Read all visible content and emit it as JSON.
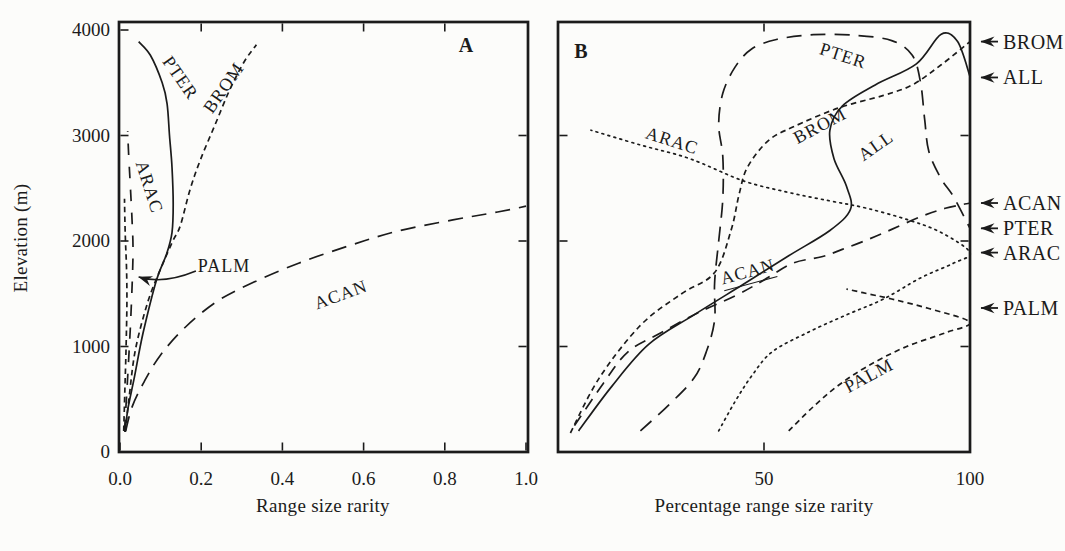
{
  "figure_ink_color": "#1b1b1b",
  "background_color": "#fcfcfa",
  "chart_data": [
    {
      "id": "A",
      "type": "line",
      "panel_label": "A",
      "xlabel": "Range size rarity",
      "ylabel": "Elevation (m)",
      "xlim": [
        0.0,
        1.0
      ],
      "ylim": [
        0,
        4000
      ],
      "grid": false,
      "x_tick_values": [
        0.0,
        0.2,
        0.4,
        0.6,
        0.8,
        1.0
      ],
      "x_tick_labels": [
        "0.0",
        "0.2",
        "0.4",
        "0.6",
        "0.8",
        "1.0"
      ],
      "x_top_tick_values": [
        0.2,
        0.4,
        0.6,
        0.8
      ],
      "y_tick_values": [
        1000,
        2000,
        3000,
        4000
      ],
      "y_right_tick_values": [
        1000,
        2000,
        3000
      ],
      "y_tick_labels": [
        {
          "v": 0,
          "t": "0"
        },
        {
          "v": 1000,
          "t": "1000"
        },
        {
          "v": 2000,
          "t": "2000"
        },
        {
          "v": 3000,
          "t": "3000"
        },
        {
          "v": 4000,
          "t": "4000"
        }
      ],
      "series": [
        {
          "name": "PTER",
          "style": "solid",
          "points": [
            [
              0.012,
              190
            ],
            [
              0.02,
              420
            ],
            [
              0.035,
              700
            ],
            [
              0.057,
              1130
            ],
            [
              0.09,
              1630
            ],
            [
              0.115,
              1880
            ],
            [
              0.128,
              2080
            ],
            [
              0.131,
              2350
            ],
            [
              0.128,
              2700
            ],
            [
              0.122,
              3000
            ],
            [
              0.116,
              3300
            ],
            [
              0.104,
              3500
            ],
            [
              0.075,
              3760
            ],
            [
              0.046,
              3890
            ]
          ],
          "label": {
            "text": "PTER",
            "x": 0.148,
            "el": 3545,
            "rot": 55
          }
        },
        {
          "name": "BROM",
          "style": "dash-short",
          "points": [
            [
              0.013,
              190
            ],
            [
              0.022,
              500
            ],
            [
              0.038,
              970
            ],
            [
              0.07,
              1440
            ],
            [
              0.105,
              1780
            ],
            [
              0.13,
              2000
            ],
            [
              0.149,
              2150
            ],
            [
              0.172,
              2480
            ],
            [
              0.198,
              2770
            ],
            [
              0.234,
              3100
            ],
            [
              0.27,
              3430
            ],
            [
              0.306,
              3700
            ],
            [
              0.336,
              3860
            ]
          ],
          "label": {
            "text": "BROM",
            "x": 0.256,
            "el": 3450,
            "rot": -55
          }
        },
        {
          "name": "ACAN",
          "style": "dash-long",
          "points": [
            [
              0.014,
              200
            ],
            [
              0.03,
              430
            ],
            [
              0.06,
              670
            ],
            [
              0.1,
              920
            ],
            [
              0.16,
              1180
            ],
            [
              0.24,
              1430
            ],
            [
              0.33,
              1610
            ],
            [
              0.44,
              1790
            ],
            [
              0.56,
              1950
            ],
            [
              0.68,
              2090
            ],
            [
              0.82,
              2200
            ],
            [
              0.93,
              2275
            ],
            [
              1.0,
              2330
            ]
          ],
          "label": {
            "text": "ACAN",
            "x": 0.544,
            "el": 1488,
            "rot": -20
          }
        },
        {
          "name": "ARAC",
          "style": "dash-long-sparse",
          "points": [
            [
              0.011,
              200
            ],
            [
              0.018,
              650
            ],
            [
              0.025,
              1150
            ],
            [
              0.03,
              1600
            ],
            [
              0.032,
              1950
            ],
            [
              0.029,
              2250
            ],
            [
              0.025,
              2550
            ],
            [
              0.021,
              2850
            ],
            [
              0.019,
              3040
            ]
          ],
          "label": {
            "text": "ARAC",
            "x": 0.071,
            "el": 2512,
            "rot": 72
          }
        },
        {
          "name": "PALM",
          "style": "dash-short",
          "points": [
            [
              0.009,
              200
            ],
            [
              0.012,
              600
            ],
            [
              0.015,
              1000
            ],
            [
              0.017,
              1400
            ],
            [
              0.016,
              1750
            ],
            [
              0.013,
              2050
            ],
            [
              0.011,
              2400
            ]
          ],
          "label": {
            "text": "PALM",
            "x": 0.256,
            "el": 1763,
            "rot": 0
          }
        }
      ],
      "callout": {
        "for_series": "PALM",
        "from_x": 0.187,
        "from_el": 1715,
        "mid_x": 0.105,
        "mid_el": 1585,
        "to_x": 0.046,
        "to_el": 1660
      }
    },
    {
      "id": "B",
      "type": "line",
      "panel_label": "B",
      "xlabel": "Percentage range size rarity",
      "ylabel": "Elevation (m)",
      "xlim": [
        0,
        100
      ],
      "ylim": [
        0,
        4000
      ],
      "grid": false,
      "x_tick_values": [
        50,
        100
      ],
      "x_tick_labels": [
        "50",
        "100"
      ],
      "x_top_tick_values": [
        50
      ],
      "y_tick_values": [
        1000,
        2000,
        3000
      ],
      "y_right_tick_values": [
        1000,
        2000,
        3000
      ],
      "y_tick_labels": [],
      "series": [
        {
          "name": "ALL",
          "style": "solid",
          "points": [
            [
              5,
              200
            ],
            [
              13,
              620
            ],
            [
              22,
              1020
            ],
            [
              33,
              1300
            ],
            [
              45,
              1590
            ],
            [
              56,
              1860
            ],
            [
              66,
              2100
            ],
            [
              71,
              2300
            ],
            [
              70,
              2520
            ],
            [
              67,
              2780
            ],
            [
              66,
              3050
            ],
            [
              69,
              3280
            ],
            [
              77,
              3480
            ],
            [
              87,
              3680
            ],
            [
              93,
              3960
            ],
            [
              97,
              3890
            ],
            [
              100,
              3560
            ]
          ],
          "label": {
            "text": "ALL",
            "x": 77.2,
            "el": 2900,
            "rot": -35
          }
        },
        {
          "name": "PTER",
          "style": "dash-long",
          "points": [
            [
              20,
              200
            ],
            [
              27,
              450
            ],
            [
              33,
              700
            ],
            [
              36,
              950
            ],
            [
              38,
              1250
            ],
            [
              38,
              1600
            ],
            [
              39,
              2000
            ],
            [
              40,
              2400
            ],
            [
              40,
              2800
            ],
            [
              39,
              3100
            ],
            [
              40,
              3400
            ],
            [
              43,
              3650
            ],
            [
              47,
              3820
            ],
            [
              53,
              3910
            ],
            [
              62,
              3955
            ],
            [
              72,
              3950
            ],
            [
              81,
              3900
            ],
            [
              86,
              3760
            ],
            [
              88,
              3500
            ],
            [
              89,
              3150
            ],
            [
              90,
              2850
            ],
            [
              93,
              2590
            ],
            [
              96,
              2420
            ],
            [
              100,
              2120
            ]
          ],
          "label": {
            "text": "PTER",
            "x": 69.2,
            "el": 3754,
            "rot": 18
          }
        },
        {
          "name": "BROM",
          "style": "dash-short",
          "points": [
            [
              3,
              180
            ],
            [
              10,
              700
            ],
            [
              20,
              1200
            ],
            [
              30,
              1500
            ],
            [
              38,
              1700
            ],
            [
              42,
              2100
            ],
            [
              44,
              2450
            ],
            [
              46,
              2700
            ],
            [
              51,
              2950
            ],
            [
              57,
              3080
            ],
            [
              68,
              3260
            ],
            [
              79,
              3380
            ],
            [
              86,
              3480
            ],
            [
              93,
              3670
            ],
            [
              100,
              3890
            ]
          ],
          "label": {
            "text": "BROM",
            "x": 63.6,
            "el": 3090,
            "rot": -28
          }
        },
        {
          "name": "ACAN",
          "style": "dash-med",
          "points": [
            [
              4,
              250
            ],
            [
              11,
              650
            ],
            [
              17,
              950
            ],
            [
              25,
              1130
            ],
            [
              34,
              1320
            ],
            [
              43,
              1480
            ],
            [
              50,
              1630
            ],
            [
              57,
              1790
            ],
            [
              64,
              1850
            ],
            [
              69,
              1920
            ],
            [
              75,
              2010
            ],
            [
              81,
              2110
            ],
            [
              88,
              2230
            ],
            [
              94,
              2310
            ],
            [
              100,
              2360
            ]
          ],
          "label": {
            "text": "ACAN",
            "x": 46.1,
            "el": 1697,
            "rot": -15,
            "underline": true
          }
        },
        {
          "name": "ARAC",
          "style": "dotted",
          "points": [
            [
              39,
              200
            ],
            [
              43,
              480
            ],
            [
              47,
              720
            ],
            [
              52,
              950
            ],
            [
              61,
              1140
            ],
            [
              70,
              1300
            ],
            [
              79,
              1450
            ],
            [
              88,
              1650
            ],
            [
              96,
              1790
            ],
            [
              100,
              1890
            ],
            [
              93,
              2080
            ],
            [
              85,
              2200
            ],
            [
              75,
              2310
            ],
            [
              66,
              2380
            ],
            [
              56,
              2460
            ],
            [
              45,
              2570
            ],
            [
              32,
              2780
            ],
            [
              20,
              2910
            ],
            [
              8,
              3050
            ]
          ],
          "label": {
            "text": "ARAC",
            "x": 27.7,
            "el": 2948,
            "rot": 18
          }
        },
        {
          "name": "PALM",
          "style": "dash-short",
          "points": [
            [
              56,
              200
            ],
            [
              62,
              430
            ],
            [
              68,
              630
            ],
            [
              75,
              810
            ],
            [
              84,
              990
            ],
            [
              94,
              1130
            ],
            [
              100,
              1230
            ],
            [
              90,
              1360
            ],
            [
              81,
              1450
            ],
            [
              74,
              1510
            ],
            [
              70,
              1545
            ]
          ],
          "label": {
            "text": "PALM",
            "x": 75.5,
            "el": 720,
            "rot": -28
          }
        }
      ],
      "arrows": [
        {
          "label": "BROM",
          "el": 3890
        },
        {
          "label": "ALL",
          "el": 3550
        },
        {
          "label": "ACAN",
          "el": 2360
        },
        {
          "label": "PTER",
          "el": 2120
        },
        {
          "label": "ARAC",
          "el": 1890
        },
        {
          "label": "PALM",
          "el": 1365
        }
      ]
    }
  ]
}
